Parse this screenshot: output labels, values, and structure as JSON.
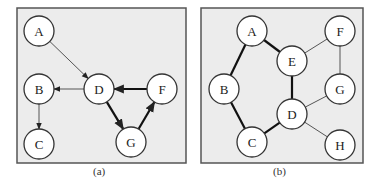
{
  "colors": {
    "panel_bg": "#ececec",
    "panel_border": "#555555",
    "node_fill": "#ffffff",
    "edge": "#333333"
  },
  "panels": [
    {
      "caption": "(a)",
      "type": "directed",
      "nodes": [
        {
          "id": "A",
          "x": 39,
          "y": 31
        },
        {
          "id": "B",
          "x": 39,
          "y": 89
        },
        {
          "id": "C",
          "x": 39,
          "y": 144
        },
        {
          "id": "D",
          "x": 99,
          "y": 89
        },
        {
          "id": "F",
          "x": 162,
          "y": 89
        },
        {
          "id": "G",
          "x": 131,
          "y": 142
        }
      ],
      "edges": [
        {
          "from": "A",
          "to": "D",
          "bold": false
        },
        {
          "from": "D",
          "to": "B",
          "bold": false
        },
        {
          "from": "B",
          "to": "C",
          "bold": false
        },
        {
          "from": "D",
          "to": "G",
          "bold": true
        },
        {
          "from": "G",
          "to": "F",
          "bold": true
        },
        {
          "from": "F",
          "to": "D",
          "bold": true
        }
      ]
    },
    {
      "caption": "(b)",
      "type": "undirected",
      "nodes": [
        {
          "id": "A",
          "x": 252,
          "y": 31
        },
        {
          "id": "E",
          "x": 292,
          "y": 61
        },
        {
          "id": "F",
          "x": 340,
          "y": 31
        },
        {
          "id": "B",
          "x": 224,
          "y": 89
        },
        {
          "id": "G",
          "x": 340,
          "y": 89
        },
        {
          "id": "D",
          "x": 292,
          "y": 114
        },
        {
          "id": "C",
          "x": 252,
          "y": 142
        },
        {
          "id": "H",
          "x": 340,
          "y": 145
        }
      ],
      "edges": [
        {
          "from": "A",
          "to": "B",
          "bold": true
        },
        {
          "from": "A",
          "to": "E",
          "bold": true
        },
        {
          "from": "B",
          "to": "C",
          "bold": true
        },
        {
          "from": "C",
          "to": "D",
          "bold": true
        },
        {
          "from": "D",
          "to": "E",
          "bold": true
        },
        {
          "from": "E",
          "to": "F",
          "bold": false
        },
        {
          "from": "F",
          "to": "G",
          "bold": false
        },
        {
          "from": "G",
          "to": "D",
          "bold": false
        },
        {
          "from": "D",
          "to": "H",
          "bold": false
        }
      ]
    }
  ]
}
